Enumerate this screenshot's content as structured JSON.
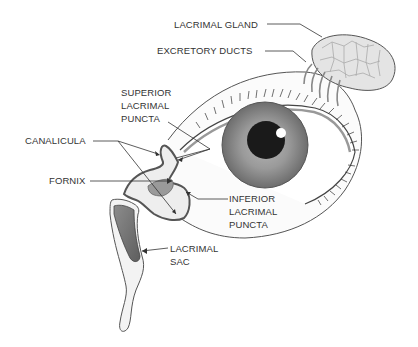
{
  "diagram": {
    "labels": {
      "lacrimal_gland": "LACRIMAL GLAND",
      "excretory_ducts": "EXCRETORY DUCTS",
      "superior_puncta": [
        "SUPERIOR",
        "LACRIMAL",
        "PUNCTA"
      ],
      "canalicula": "CANALICULA",
      "fornix": "FORNIX",
      "inferior_puncta": [
        "INFERIOR",
        "LACRIMAL",
        "PUNCTA"
      ],
      "lacrimal_sac": [
        "LACRIMAL",
        "SAC"
      ]
    },
    "colors": {
      "outline": "#444444",
      "iris": "#8a8a8a",
      "pupil": "#1a1a1a",
      "sac_fill": "#7a7a7a",
      "gland_fill": "#dcdcdc"
    }
  }
}
